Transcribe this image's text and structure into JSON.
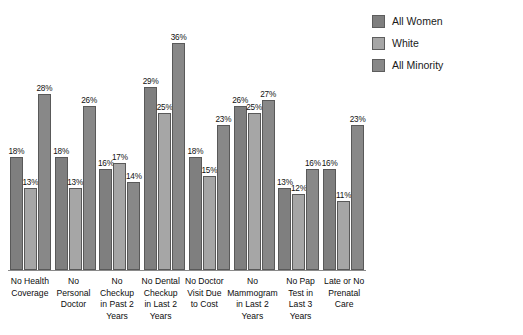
{
  "chart_data": {
    "type": "bar",
    "title": "",
    "subtitle": "",
    "xlabel": "",
    "ylabel": "",
    "ylim": [
      0,
      40
    ],
    "grid": false,
    "legend_position": "top-right",
    "categories": [
      "No Health Coverage",
      "No Personal Doctor",
      "No Checkup in Past 2 Years",
      "No Dental Checkup in Last 2 Years",
      "No Doctor Visit Due to Cost",
      "No Mammogram in Last 2 Years",
      "No Pap Test in Last 3 Years",
      "Late or No Prenatal Care"
    ],
    "series": [
      {
        "name": "All Women",
        "color": "#7f7f7f",
        "values": [
          18,
          18,
          16,
          29,
          18,
          26,
          13,
          16
        ],
        "labels": [
          "18%",
          "18%",
          "16%",
          "29%",
          "18%",
          "26%",
          "13%",
          "16%"
        ]
      },
      {
        "name": "White",
        "color": "#a6a6a6",
        "values": [
          13,
          13,
          17,
          25,
          15,
          25,
          12,
          11
        ],
        "labels": [
          "13%",
          "13%",
          "17%",
          "25%",
          "15%",
          "25%",
          "12%",
          "11%"
        ]
      },
      {
        "name": "All Minority",
        "color": "#888888",
        "values": [
          28,
          26,
          14,
          36,
          23,
          27,
          16,
          23
        ],
        "labels": [
          "28%",
          "26%",
          "14%",
          "36%",
          "23%",
          "27%",
          "16%",
          "23%"
        ]
      }
    ]
  },
  "legend": {
    "items": [
      {
        "label": "All Women"
      },
      {
        "label": "White"
      },
      {
        "label": "All Minority"
      }
    ]
  }
}
